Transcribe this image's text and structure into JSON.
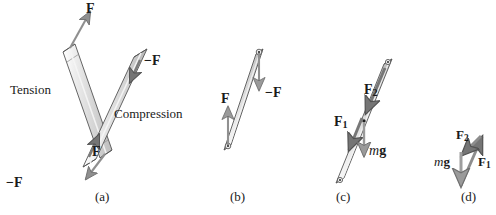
{
  "figure": {
    "background_color": "#ffffff",
    "bar_fill_light": "#e3e3e3",
    "bar_fill_mid": "#cfcfcf",
    "bar_fill_dark": "#a9a9a9",
    "arrow_color": "#8a8a8a",
    "arrow_dark_color": "#6e6e6e",
    "outline_color": "#3c3c3c",
    "text_color": "#1a1a1a"
  },
  "panels": [
    {
      "id": "a",
      "caption": "(a)",
      "description": "Two rods: one in tension with outward forces, one in compression with inward forces",
      "labels": {
        "tension": "Tension",
        "compression": "Compression",
        "force_top": "F",
        "force_bottom": "−F",
        "comp_force_top": "−F",
        "comp_force_bottom": "F"
      }
    },
    {
      "id": "b",
      "caption": "(b)",
      "description": "Single bar with pivot holes at both ends; upward force F at lower end and downward force −F at upper end",
      "labels": {
        "force_lower": "F",
        "force_upper": "−F"
      }
    },
    {
      "id": "c",
      "caption": "(c)",
      "description": "Bar with forces F1 and F2 acting along it and weight mg acting downward from the center",
      "labels": {
        "force_1": "F",
        "force_1_sub": "1",
        "force_2": "F",
        "force_2_sub": "2",
        "weight_italic": "m",
        "weight_bold": "g"
      }
    },
    {
      "id": "d",
      "caption": "(d)",
      "description": "Closed vector triangle of F1, F2 and mg showing equilibrium",
      "labels": {
        "force_1": "F",
        "force_1_sub": "1",
        "force_2": "F",
        "force_2_sub": "2",
        "weight_italic": "m",
        "weight_bold": "g"
      }
    }
  ],
  "text_items": {
    "a_force_top": "F",
    "a_force_bottom": "−F",
    "a_tension": "Tension",
    "a_comp_force_top": "−F",
    "a_comp_force_bottom": "F",
    "a_compression": "Compression",
    "a_caption": "(a)",
    "b_force_lower": "F",
    "b_force_upper": "−F",
    "b_caption": "(b)",
    "c_f1_main": "F",
    "c_f1_sub": "1",
    "c_f2_main": "F",
    "c_f2_sub": "2",
    "c_mg_m": "m",
    "c_mg_g": "g",
    "c_caption": "(c)",
    "d_f1_main": "F",
    "d_f1_sub": "1",
    "d_f2_main": "F",
    "d_f2_sub": "2",
    "d_mg_m": "m",
    "d_mg_g": "g",
    "d_caption": "(d)"
  }
}
